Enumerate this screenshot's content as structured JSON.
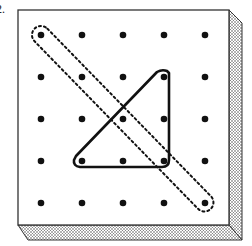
{
  "problem": {
    "number_label": "2."
  },
  "geoboard": {
    "grid": {
      "rows": 5,
      "cols": 5
    },
    "pegs_x": [
      41,
      82,
      123,
      164,
      205
    ],
    "pegs_y": [
      35,
      77,
      119,
      161,
      203
    ],
    "board": {
      "left": 18,
      "top": 10,
      "right": 229,
      "bottom": 225,
      "side_depth": 13
    },
    "bands": [
      {
        "name": "triangle",
        "style": "solid",
        "pegs": [
          [
            3,
            1
          ],
          [
            1,
            3
          ],
          [
            3,
            3
          ]
        ]
      },
      {
        "name": "diagonal-segment",
        "style": "dotted",
        "pegs": [
          [
            0,
            0
          ],
          [
            4,
            4
          ]
        ]
      }
    ],
    "colors": {
      "board_face": "#ffffff",
      "edge": "#333333",
      "peg": "#111111",
      "band": "#111111",
      "shading": "#999999"
    }
  }
}
